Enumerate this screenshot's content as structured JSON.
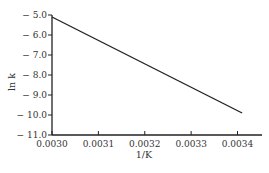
{
  "header_fragment": "...ergy, kJ/mol",
  "chart_data": {
    "type": "line",
    "title": "",
    "xlabel": "1/K",
    "ylabel": "ln k",
    "xlim": [
      0.003,
      0.00342
    ],
    "ylim": [
      -11.0,
      -5.0
    ],
    "x_ticks": [
      "0.0030",
      "0.0031",
      "0.0032",
      "0.0033",
      "0.0034"
    ],
    "y_ticks": [
      "-5.0",
      "-6.0",
      "-7.0",
      "-8.0",
      "-9.0",
      "-10.0",
      "-11.0"
    ],
    "grid": false,
    "legend": null,
    "series": [
      {
        "name": "ln k vs 1/T",
        "x": [
          0.003,
          0.00341
        ],
        "y": [
          -5.1,
          -9.9
        ]
      }
    ]
  }
}
